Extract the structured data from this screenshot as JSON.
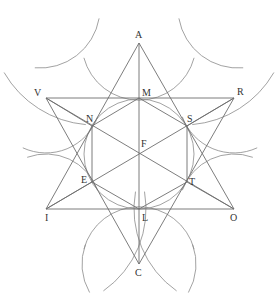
{
  "diagram": {
    "stroke_color": "#6e6e6e",
    "arc_color": "#8a8a8a",
    "label_color": "#333333",
    "points": {
      "A": {
        "label": "A",
        "x": 139,
        "y": 43
      },
      "V": {
        "label": "V",
        "x": 46,
        "y": 98
      },
      "R": {
        "label": "R",
        "x": 234,
        "y": 98
      },
      "M": {
        "label": "M",
        "x": 139,
        "y": 98
      },
      "N": {
        "label": "N",
        "x": 92,
        "y": 126
      },
      "S": {
        "label": "S",
        "x": 187,
        "y": 126
      },
      "F": {
        "label": "F",
        "x": 139,
        "y": 154
      },
      "E": {
        "label": "E",
        "x": 92,
        "y": 182
      },
      "T": {
        "label": "T",
        "x": 187,
        "y": 182
      },
      "I": {
        "label": "I",
        "x": 46,
        "y": 209
      },
      "L": {
        "label": "L",
        "x": 139,
        "y": 209
      },
      "O": {
        "label": "O",
        "x": 234,
        "y": 209
      },
      "C": {
        "label": "C",
        "x": 139,
        "y": 264
      }
    },
    "labels": [
      {
        "text": "A",
        "x": 135,
        "y": 38
      },
      {
        "text": "V",
        "x": 34,
        "y": 96
      },
      {
        "text": "M",
        "x": 142,
        "y": 96
      },
      {
        "text": "R",
        "x": 237,
        "y": 95
      },
      {
        "text": "N",
        "x": 86,
        "y": 122
      },
      {
        "text": "S",
        "x": 187,
        "y": 122
      },
      {
        "text": "F",
        "x": 141,
        "y": 147
      },
      {
        "text": "E",
        "x": 81,
        "y": 183
      },
      {
        "text": "T",
        "x": 189,
        "y": 185
      },
      {
        "text": "I",
        "x": 45,
        "y": 221
      },
      {
        "text": "L",
        "x": 142,
        "y": 221
      },
      {
        "text": "O",
        "x": 230,
        "y": 221
      },
      {
        "text": "C",
        "x": 135,
        "y": 276
      }
    ],
    "segments": [
      [
        "A",
        "I"
      ],
      [
        "A",
        "O"
      ],
      [
        "I",
        "O"
      ],
      [
        "V",
        "R"
      ],
      [
        "V",
        "C"
      ],
      [
        "R",
        "C"
      ],
      [
        "A",
        "C"
      ],
      [
        "V",
        "O"
      ],
      [
        "R",
        "I"
      ],
      [
        "V",
        "N"
      ],
      [
        "R",
        "S"
      ],
      [
        "I",
        "E"
      ],
      [
        "O",
        "T"
      ],
      [
        "N",
        "E"
      ],
      [
        "S",
        "T"
      ],
      [
        "M",
        "N"
      ],
      [
        "M",
        "S"
      ],
      [
        "L",
        "E"
      ],
      [
        "L",
        "T"
      ]
    ],
    "inscribed_circle": {
      "cx": 139,
      "cy": 154,
      "r": 55
    },
    "arcs": [
      {
        "name": "arc-top-left",
        "d": "M 40 43 Q 95 40 100 90 M 96 10 Q 80 40 92 126"
      },
      {
        "name": "arc-top-right",
        "d": "M 238 43 Q 183 40 178 90 M 183 10 Q 198 40 187 126"
      },
      {
        "name": "arc-left",
        "d": "M 12 143 Q 46 165 92 126 M 20 155 Q 60 135 92 182"
      },
      {
        "name": "arc-right",
        "d": "M 266 143 Q 232 165 187 126 M 258 155 Q 218 135 187 182"
      },
      {
        "name": "arc-bottom-left",
        "d": "M 38 262 Q 80 262 92 182 M 92 290 Q 80 230 139 209"
      },
      {
        "name": "arc-bottom-right",
        "d": "M 200 252 Q 180 230 187 182 M 193 275 Q 198 215 139 209"
      }
    ]
  }
}
